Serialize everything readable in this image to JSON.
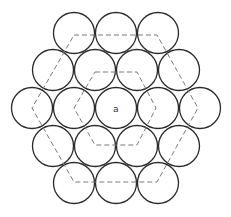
{
  "diagram": {
    "center_label": "a",
    "colors": {
      "circle_stroke": "#2b2b2b",
      "dashed_stroke": "#7a7a7a",
      "background": "#ffffff"
    },
    "circle_radius": 20.5,
    "circles": [
      {
        "x": 74,
        "y": 33
      },
      {
        "x": 116,
        "y": 33
      },
      {
        "x": 158,
        "y": 33
      },
      {
        "x": 53,
        "y": 70
      },
      {
        "x": 95,
        "y": 70
      },
      {
        "x": 137,
        "y": 70
      },
      {
        "x": 179,
        "y": 70
      },
      {
        "x": 32,
        "y": 108
      },
      {
        "x": 74,
        "y": 108
      },
      {
        "x": 116,
        "y": 108
      },
      {
        "x": 158,
        "y": 108
      },
      {
        "x": 200,
        "y": 108
      },
      {
        "x": 53,
        "y": 146
      },
      {
        "x": 95,
        "y": 146
      },
      {
        "x": 137,
        "y": 146
      },
      {
        "x": 179,
        "y": 146
      },
      {
        "x": 74,
        "y": 183
      },
      {
        "x": 116,
        "y": 183
      },
      {
        "x": 158,
        "y": 183
      }
    ],
    "outer_hexagon": "74,35 157,35 198,108 157,182 74,182 32,108",
    "inner_hexagon": "95,72 137,72 156,108 137,145 95,145 74,108",
    "label_position": {
      "x": 113,
      "y": 112
    }
  }
}
